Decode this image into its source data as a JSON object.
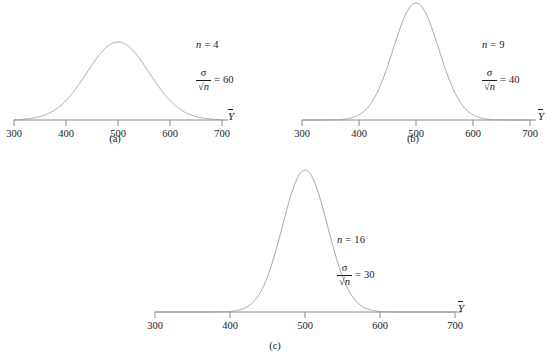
{
  "figure": {
    "background": "#ffffff",
    "curve_color": "#9a9a9a",
    "axis_color": "#8c8c8c",
    "text_color": "#1a1a1a",
    "axis_variable": "Y",
    "axis_variable_label": "Ȳ"
  },
  "chart_data": {
    "type": "line",
    "title": "",
    "subtitle": "",
    "xlabel": "Ȳ",
    "ylabel": "",
    "grid": false,
    "legend": "none",
    "xlim": [
      300,
      700
    ],
    "xticks": [
      300,
      400,
      500,
      600,
      700
    ],
    "xtick_labels": [
      "300",
      "400",
      "500",
      "600",
      "700"
    ],
    "shared_mean": 500,
    "distribution": "normal",
    "panels": [
      {
        "id": "a",
        "caption": "(a)",
        "n_label": "n",
        "n_equals": "=",
        "n_value": "4",
        "se_numerator": "σ",
        "se_denominator": "√n",
        "se_equals": "=",
        "se_value": "60",
        "mean": 500,
        "std_error": 60,
        "peak_height_px": 78,
        "x_values": [
          300,
          320,
          340,
          360,
          380,
          400,
          420,
          440,
          460,
          480,
          500,
          520,
          540,
          560,
          580,
          600,
          620,
          640,
          660,
          680,
          700
        ],
        "y_values": [
          0.0007,
          0.0026,
          0.0081,
          0.0209,
          0.0457,
          0.0861,
          0.1423,
          0.2096,
          0.278,
          0.334,
          0.3546,
          0.334,
          0.278,
          0.2096,
          0.1423,
          0.0861,
          0.0457,
          0.0209,
          0.0081,
          0.0026,
          0.0007
        ]
      },
      {
        "id": "b",
        "caption": "(b)",
        "n_label": "n",
        "n_equals": "=",
        "n_value": "9",
        "se_numerator": "σ",
        "se_denominator": "√n",
        "se_equals": "=",
        "se_value": "40",
        "mean": 500,
        "std_error": 40,
        "peak_height_px": 117,
        "x_values": [
          300,
          320,
          340,
          360,
          380,
          400,
          420,
          440,
          460,
          480,
          500,
          520,
          540,
          560,
          580,
          600,
          620,
          640,
          660,
          680,
          700
        ],
        "y_values": [
          0.0,
          0.0,
          0.0002,
          0.0011,
          0.0066,
          0.027,
          0.0808,
          0.176,
          0.28,
          0.3247,
          0.3546,
          0.3247,
          0.28,
          0.176,
          0.0808,
          0.027,
          0.0066,
          0.0011,
          0.0002,
          0.0,
          0.0
        ]
      },
      {
        "id": "c",
        "caption": "(c)",
        "n_label": "n",
        "n_equals": "=",
        "n_value": "16",
        "se_numerator": "σ",
        "se_denominator": "√n",
        "se_equals": "=",
        "se_value": "30",
        "mean": 500,
        "std_error": 30,
        "peak_height_px": 142,
        "x_values": [
          300,
          320,
          340,
          360,
          380,
          400,
          420,
          440,
          460,
          480,
          500,
          520,
          540,
          560,
          580,
          600,
          620,
          640,
          660,
          680,
          700
        ],
        "y_values": [
          0.0,
          0.0,
          0.0,
          0.0,
          0.0004,
          0.0045,
          0.0344,
          0.1455,
          0.3143,
          0.3546,
          0.3989,
          0.3546,
          0.3143,
          0.1455,
          0.0344,
          0.0045,
          0.0004,
          0.0,
          0.0,
          0.0,
          0.0
        ]
      }
    ]
  }
}
